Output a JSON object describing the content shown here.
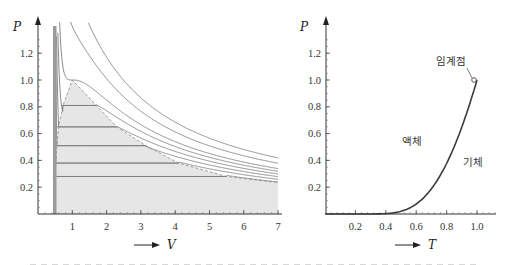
{
  "chart_data": [
    {
      "type": "line",
      "title": "",
      "xlabel": "V",
      "ylabel": "P",
      "xlim": [
        0,
        7.2
      ],
      "ylim": [
        0,
        1.35
      ],
      "x_ticks": [
        1,
        2,
        3,
        4,
        5,
        6,
        7
      ],
      "x_tick_labels": [
        "1",
        "2",
        "3",
        "4",
        "5",
        "6",
        "7"
      ],
      "y_ticks": [
        0.2,
        0.4,
        0.6,
        0.8,
        1.0,
        1.2
      ],
      "y_tick_labels": [
        "0.2",
        "0.4",
        "0.6",
        "0.8",
        "1.0",
        "1.2"
      ],
      "grid": false,
      "legend": null,
      "description": "Van der Waals isotherms in reduced units (P = 8T/(3V-1) - 3/V^2) with coexistence dome shaded gray and Maxwell tie lines",
      "isotherm_temperatures": [
        0.75,
        0.8,
        0.85,
        0.9,
        0.95,
        1.0,
        1.1,
        1.2
      ],
      "tie_lines": [
        {
          "P": 0.81,
          "V_liquid": 0.73,
          "V_gas": 1.7
        },
        {
          "P": 0.65,
          "V_liquid": 0.6,
          "V_gas": 2.3
        },
        {
          "P": 0.51,
          "V_liquid": 0.55,
          "V_gas": 3.15
        },
        {
          "P": 0.38,
          "V_liquid": 0.52,
          "V_gas": 4.1
        },
        {
          "P": 0.28,
          "V_liquid": 0.49,
          "V_gas": 5.5
        }
      ],
      "dome_boundary": {
        "V": [
          0.46,
          0.49,
          0.52,
          0.55,
          0.6,
          0.73,
          1.0,
          1.7,
          2.3,
          3.15,
          4.1,
          5.5,
          7.0
        ],
        "P": [
          0.0,
          0.28,
          0.38,
          0.51,
          0.65,
          0.81,
          1.0,
          0.81,
          0.65,
          0.51,
          0.38,
          0.28,
          0.235
        ]
      },
      "critical_point": {
        "V": 1.0,
        "P": 1.0
      },
      "colors": {
        "curve": "#7a7a7a",
        "tie_line": "#8a8a8a",
        "dome_fill": "#e4e4e4",
        "dome_edge": "#9a9a9a"
      }
    },
    {
      "type": "line",
      "title": "",
      "xlabel": "T",
      "ylabel": "P",
      "xlim": [
        0,
        1.12
      ],
      "ylim": [
        0,
        1.35
      ],
      "x_ticks": [
        0.2,
        0.4,
        0.6,
        0.8,
        1.0
      ],
      "x_tick_labels": [
        "0.2",
        "0.4",
        "0.6",
        "0.8",
        "1.0"
      ],
      "y_ticks": [
        0.2,
        0.4,
        0.6,
        0.8,
        1.0,
        1.2
      ],
      "y_tick_labels": [
        "0.2",
        "0.4",
        "0.6",
        "0.8",
        "1.0",
        "1.2"
      ],
      "grid": false,
      "legend": null,
      "series": [
        {
          "name": "liquid-gas coexistence curve",
          "x": [
            0.0,
            0.2,
            0.3,
            0.4,
            0.45,
            0.5,
            0.55,
            0.6,
            0.65,
            0.7,
            0.75,
            0.8,
            0.85,
            0.9,
            0.95,
            1.0
          ],
          "y": [
            0.0,
            0.0,
            0.0,
            0.003,
            0.008,
            0.02,
            0.041,
            0.074,
            0.122,
            0.188,
            0.27,
            0.377,
            0.503,
            0.648,
            0.814,
            1.0
          ]
        }
      ],
      "annotations": [
        {
          "text": "임계점",
          "T": 1.0,
          "P": 1.0,
          "role": "critical point label"
        },
        {
          "text": "액체",
          "T": 0.58,
          "P": 0.55,
          "role": "liquid region"
        },
        {
          "text": "기체",
          "T": 0.98,
          "P": 0.39,
          "role": "gas region"
        }
      ],
      "colors": {
        "curve": "#3a3a3a"
      }
    }
  ],
  "labels": {
    "left_y": "P",
    "left_x": "V",
    "right_y": "P",
    "right_x": "T",
    "critical_point": "임계점",
    "liquid": "액체",
    "gas": "기체"
  }
}
